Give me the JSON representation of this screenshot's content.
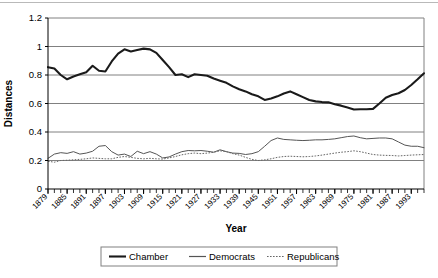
{
  "chart_data": {
    "type": "line",
    "title": "",
    "xlabel": "Year",
    "ylabel": "Distances",
    "ylim": [
      0,
      1.2
    ],
    "xlim": [
      1879,
      1997
    ],
    "grid": true,
    "legend_position": "bottom",
    "ytick_labels": [
      "0",
      "0.2",
      "0.4",
      "0.6",
      "0.8",
      "1",
      "1.2"
    ],
    "ytick_values": [
      0,
      0.2,
      0.4,
      0.6,
      0.8,
      1,
      1.2
    ],
    "xtick_labels": [
      "1879",
      "1885",
      "1891",
      "1897",
      "1903",
      "1909",
      "1915",
      "1921",
      "1927",
      "1933",
      "1939",
      "1945",
      "1951",
      "1957",
      "1963",
      "1969",
      "1975",
      "1981",
      "1987",
      "1993"
    ],
    "xtick_values": [
      1879,
      1885,
      1891,
      1897,
      1903,
      1909,
      1915,
      1921,
      1927,
      1933,
      1939,
      1945,
      1951,
      1957,
      1963,
      1969,
      1975,
      1981,
      1987,
      1993
    ],
    "minor_tick_step": 2,
    "x": [
      1879,
      1881,
      1883,
      1885,
      1887,
      1889,
      1891,
      1893,
      1895,
      1897,
      1899,
      1901,
      1903,
      1905,
      1907,
      1909,
      1911,
      1913,
      1915,
      1917,
      1919,
      1921,
      1923,
      1925,
      1927,
      1929,
      1931,
      1933,
      1935,
      1937,
      1939,
      1941,
      1943,
      1945,
      1947,
      1949,
      1951,
      1953,
      1955,
      1957,
      1959,
      1961,
      1963,
      1965,
      1967,
      1969,
      1971,
      1973,
      1975,
      1977,
      1979,
      1981,
      1983,
      1985,
      1987,
      1989,
      1991,
      1993,
      1995,
      1997
    ],
    "series": [
      {
        "name": "Chamber",
        "style": "solid-thick",
        "color": "#1a1a1a",
        "values": [
          0.855,
          0.845,
          0.8,
          0.77,
          0.79,
          0.805,
          0.82,
          0.865,
          0.83,
          0.825,
          0.895,
          0.95,
          0.98,
          0.965,
          0.975,
          0.985,
          0.98,
          0.955,
          0.905,
          0.855,
          0.8,
          0.805,
          0.785,
          0.805,
          0.8,
          0.795,
          0.775,
          0.76,
          0.745,
          0.72,
          0.7,
          0.685,
          0.665,
          0.65,
          0.625,
          0.635,
          0.65,
          0.67,
          0.685,
          0.665,
          0.645,
          0.625,
          0.615,
          0.61,
          0.608,
          0.595,
          0.585,
          0.572,
          0.558,
          0.56,
          0.56,
          0.562,
          0.6,
          0.64,
          0.66,
          0.672,
          0.695,
          0.73,
          0.77,
          0.812
        ]
      },
      {
        "name": "Democrats",
        "style": "solid-thin",
        "color": "#555555",
        "values": [
          0.215,
          0.245,
          0.255,
          0.25,
          0.262,
          0.245,
          0.252,
          0.265,
          0.3,
          0.305,
          0.262,
          0.238,
          0.245,
          0.228,
          0.265,
          0.248,
          0.262,
          0.245,
          0.218,
          0.225,
          0.245,
          0.262,
          0.27,
          0.268,
          0.27,
          0.265,
          0.258,
          0.275,
          0.262,
          0.252,
          0.25,
          0.242,
          0.248,
          0.262,
          0.3,
          0.34,
          0.358,
          0.348,
          0.345,
          0.342,
          0.34,
          0.342,
          0.345,
          0.345,
          0.348,
          0.352,
          0.36,
          0.368,
          0.372,
          0.36,
          0.352,
          0.355,
          0.358,
          0.358,
          0.352,
          0.33,
          0.308,
          0.3,
          0.3,
          0.29
        ]
      },
      {
        "name": "Republicans",
        "style": "dotted",
        "color": "#666666",
        "values": [
          0.195,
          0.188,
          0.2,
          0.202,
          0.205,
          0.208,
          0.212,
          0.218,
          0.215,
          0.212,
          0.212,
          0.222,
          0.228,
          0.222,
          0.215,
          0.212,
          0.215,
          0.212,
          0.21,
          0.218,
          0.228,
          0.24,
          0.248,
          0.252,
          0.248,
          0.252,
          0.258,
          0.268,
          0.262,
          0.248,
          0.238,
          0.222,
          0.208,
          0.2,
          0.205,
          0.212,
          0.222,
          0.228,
          0.23,
          0.228,
          0.226,
          0.228,
          0.232,
          0.238,
          0.245,
          0.252,
          0.258,
          0.262,
          0.268,
          0.262,
          0.252,
          0.242,
          0.238,
          0.236,
          0.235,
          0.232,
          0.235,
          0.238,
          0.24,
          0.242
        ]
      }
    ]
  }
}
